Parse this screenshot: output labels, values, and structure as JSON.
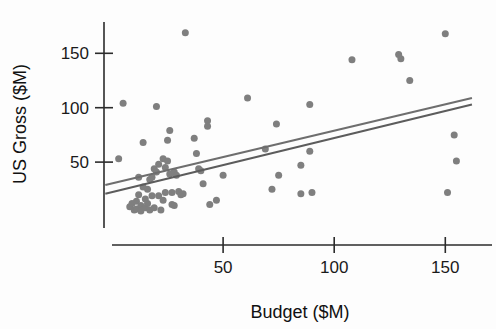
{
  "chart_data": {
    "type": "scatter",
    "title": "",
    "xlabel": "Budget ($M)",
    "ylabel": "US Gross ($M)",
    "xlim": [
      0,
      162
    ],
    "ylim": [
      0,
      176
    ],
    "xticks": [
      50,
      100,
      150
    ],
    "xticklabels": [
      "50",
      "100",
      "150"
    ],
    "yticks": [
      50,
      100,
      150
    ],
    "yticklabels": [
      "50",
      "100",
      "150"
    ],
    "grid": false,
    "legend": null,
    "marker_color": "#7f7f7f",
    "marker_size": 7,
    "axis_color": "#2b2b2b",
    "background_color": "#fdfdfd",
    "points": [
      {
        "x": 3,
        "y": 53
      },
      {
        "x": 5,
        "y": 104
      },
      {
        "x": 8,
        "y": 9
      },
      {
        "x": 9,
        "y": 12
      },
      {
        "x": 10,
        "y": 6
      },
      {
        "x": 11,
        "y": 14
      },
      {
        "x": 11,
        "y": 7
      },
      {
        "x": 12,
        "y": 36
      },
      {
        "x": 12,
        "y": 20
      },
      {
        "x": 13,
        "y": 10
      },
      {
        "x": 13,
        "y": 5
      },
      {
        "x": 14,
        "y": 68
      },
      {
        "x": 14,
        "y": 27
      },
      {
        "x": 15,
        "y": 16
      },
      {
        "x": 15,
        "y": 8
      },
      {
        "x": 16,
        "y": 25
      },
      {
        "x": 16,
        "y": 12
      },
      {
        "x": 17,
        "y": 34
      },
      {
        "x": 17,
        "y": 6
      },
      {
        "x": 18,
        "y": 36
      },
      {
        "x": 18,
        "y": 19
      },
      {
        "x": 19,
        "y": 44
      },
      {
        "x": 19,
        "y": 8
      },
      {
        "x": 20,
        "y": 101
      },
      {
        "x": 20,
        "y": 41
      },
      {
        "x": 21,
        "y": 48
      },
      {
        "x": 21,
        "y": 19
      },
      {
        "x": 22,
        "y": 6
      },
      {
        "x": 23,
        "y": 53
      },
      {
        "x": 23,
        "y": 15
      },
      {
        "x": 24,
        "y": 45
      },
      {
        "x": 24,
        "y": 22
      },
      {
        "x": 25,
        "y": 70
      },
      {
        "x": 25,
        "y": 51
      },
      {
        "x": 26,
        "y": 79
      },
      {
        "x": 26,
        "y": 39
      },
      {
        "x": 27,
        "y": 22
      },
      {
        "x": 27,
        "y": 11
      },
      {
        "x": 28,
        "y": 41
      },
      {
        "x": 28,
        "y": 10
      },
      {
        "x": 29,
        "y": 38
      },
      {
        "x": 30,
        "y": 23
      },
      {
        "x": 31,
        "y": 20
      },
      {
        "x": 32,
        "y": 21
      },
      {
        "x": 33,
        "y": 169
      },
      {
        "x": 37,
        "y": 72
      },
      {
        "x": 38,
        "y": 58
      },
      {
        "x": 39,
        "y": 44
      },
      {
        "x": 40,
        "y": 42
      },
      {
        "x": 41,
        "y": 30
      },
      {
        "x": 43,
        "y": 88
      },
      {
        "x": 43,
        "y": 83
      },
      {
        "x": 44,
        "y": 11
      },
      {
        "x": 47,
        "y": 15
      },
      {
        "x": 50,
        "y": 38
      },
      {
        "x": 61,
        "y": 109
      },
      {
        "x": 69,
        "y": 62
      },
      {
        "x": 72,
        "y": 25
      },
      {
        "x": 74,
        "y": 85
      },
      {
        "x": 75,
        "y": 38
      },
      {
        "x": 85,
        "y": 47
      },
      {
        "x": 85,
        "y": 21
      },
      {
        "x": 89,
        "y": 103
      },
      {
        "x": 89,
        "y": 60
      },
      {
        "x": 90,
        "y": 22
      },
      {
        "x": 108,
        "y": 144
      },
      {
        "x": 129,
        "y": 149
      },
      {
        "x": 130,
        "y": 145
      },
      {
        "x": 134,
        "y": 125
      },
      {
        "x": 150,
        "y": 168
      },
      {
        "x": 151,
        "y": 22
      },
      {
        "x": 154,
        "y": 75
      },
      {
        "x": 155,
        "y": 51
      }
    ],
    "fit_lines": [
      {
        "name": "upper-fit-line",
        "color": "#6e6e6e",
        "x_start": -3,
        "y_start": 29,
        "x_end": 162,
        "y_end": 109
      },
      {
        "name": "lower-fit-line",
        "color": "#5c5c5c",
        "x_start": -3,
        "y_start": 21,
        "x_end": 162,
        "y_end": 103
      }
    ]
  }
}
